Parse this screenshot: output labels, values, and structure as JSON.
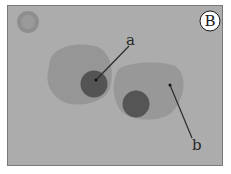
{
  "figure": {
    "panel_label": "B",
    "labels": {
      "a": "a",
      "b": "b"
    },
    "colors": {
      "background": "#acacac",
      "cytoplasm": "#969696",
      "nucleus": "#545454",
      "small_cell": "#8e8e8e",
      "leader_line": "#2a2a2a",
      "panel_circle": "#ffffff"
    }
  }
}
